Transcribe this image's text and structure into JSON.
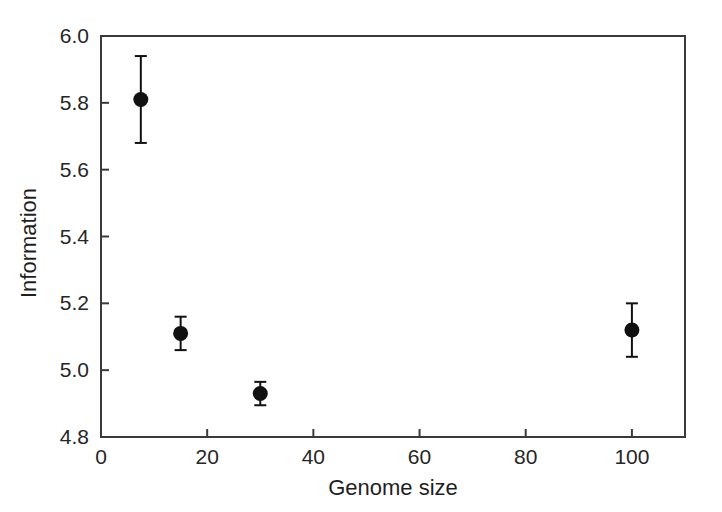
{
  "chart_data": {
    "type": "scatter",
    "title": "",
    "subtitle": "",
    "xlabel": "Genome size",
    "ylabel": "Information",
    "xlim": [
      0,
      110
    ],
    "ylim": [
      4.8,
      6.0
    ],
    "xticks": [
      0,
      20,
      40,
      60,
      80,
      100
    ],
    "xtick_labels": [
      "0",
      "20",
      "40",
      "60",
      "80",
      "100"
    ],
    "yticks": [
      4.8,
      5.0,
      5.2,
      5.4,
      5.6,
      5.8,
      6.0
    ],
    "ytick_labels": [
      "4.8",
      "5.0",
      "5.2",
      "5.4",
      "5.6",
      "5.8",
      "6.0"
    ],
    "grid": false,
    "legend": null,
    "legend_position": "none",
    "marker": "filled-circle",
    "marker_color": "#111111",
    "errorbar_color": "#111111",
    "series": [
      {
        "name": "Information",
        "points": [
          {
            "x": 7.5,
            "y": 5.81,
            "yerr": 0.13
          },
          {
            "x": 15,
            "y": 5.11,
            "yerr": 0.05
          },
          {
            "x": 30,
            "y": 4.93,
            "yerr": 0.035
          },
          {
            "x": 100,
            "y": 5.12,
            "yerr": 0.08
          }
        ]
      }
    ],
    "annotations": []
  },
  "figure": {
    "background_color": "#ffffff",
    "axis_color": "#3a3a3a",
    "text_color": "#262626"
  }
}
